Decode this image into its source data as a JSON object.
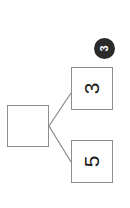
{
  "canvas": {
    "width": 130,
    "height": 208,
    "background": "#ffffff",
    "rotation_degrees": -90
  },
  "theme": {
    "node_border_color": "#8e8e8e",
    "node_fill_color": "#ffffff",
    "connector_color": "#8e8e8e",
    "label_color": "#1a1a1a",
    "badge_fill_color": "#2b2b2b",
    "badge_text_color": "#ffffff"
  },
  "badge": {
    "label": "3",
    "name": "step-badge"
  },
  "diagram": {
    "type": "tree",
    "nodes": [
      {
        "id": "parent",
        "label": "",
        "role": "parent-node",
        "x": 7,
        "y": 105,
        "width": 42,
        "height": 42
      },
      {
        "id": "child-a",
        "label": "3",
        "role": "leaf-node",
        "x": 71,
        "y": 67,
        "width": 42,
        "height": 43
      },
      {
        "id": "child-b",
        "label": "5",
        "role": "leaf-node",
        "x": 71,
        "y": 140,
        "width": 42,
        "height": 43
      }
    ],
    "edges": [
      {
        "from": "parent",
        "to": "child-a"
      },
      {
        "from": "parent",
        "to": "child-b"
      }
    ]
  }
}
